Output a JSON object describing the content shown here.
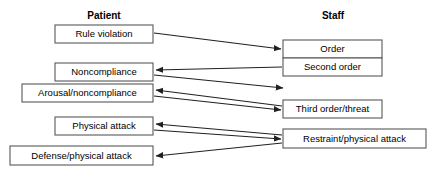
{
  "diagram": {
    "columns": [
      {
        "id": "patient",
        "label": "Patient",
        "x": 104,
        "y": 16
      },
      {
        "id": "staff",
        "label": "Staff",
        "x": 333,
        "y": 16
      }
    ],
    "colors": {
      "box_fill": "#ffffff",
      "box_stroke": "#58585a",
      "line": "#231f20",
      "text": "#000000",
      "background": "#ffffff"
    },
    "nodes": [
      {
        "id": "rule-violation",
        "label": "Rule violation",
        "column": "patient",
        "x": 55,
        "y": 25,
        "w": 98,
        "h": 18
      },
      {
        "id": "noncompliance",
        "label": "Noncompliance",
        "column": "patient",
        "x": 55,
        "y": 63,
        "w": 98,
        "h": 18
      },
      {
        "id": "arousal-noncompliance",
        "label": "Arousal/noncompliance",
        "column": "patient",
        "x": 22,
        "y": 84,
        "w": 131,
        "h": 18
      },
      {
        "id": "physical-attack",
        "label": "Physical attack",
        "column": "patient",
        "x": 55,
        "y": 117,
        "w": 98,
        "h": 18
      },
      {
        "id": "defense-physical-attack",
        "label": "Defense/physical attack",
        "column": "patient",
        "x": 10,
        "y": 146,
        "w": 143,
        "h": 19
      },
      {
        "id": "order",
        "label": "Order",
        "column": "staff",
        "x": 283,
        "y": 40,
        "w": 99,
        "h": 18
      },
      {
        "id": "second-order",
        "label": "Second order",
        "column": "staff",
        "x": 283,
        "y": 58,
        "w": 99,
        "h": 18
      },
      {
        "id": "third-order-threat",
        "label": "Third order/threat",
        "column": "staff",
        "x": 283,
        "y": 100,
        "w": 99,
        "h": 18
      },
      {
        "id": "restraint-physical-attack",
        "label": "Restraint/physical attack",
        "column": "staff",
        "x": 283,
        "y": 129,
        "w": 143,
        "h": 19
      }
    ],
    "edges": [
      {
        "id": "rule-violation-to-order",
        "from": "rule-violation",
        "to": "order",
        "x1": 154,
        "y1": 33,
        "x2": 281,
        "y2": 49
      },
      {
        "id": "second-order-to-noncompliance",
        "from": "second-order",
        "to": "noncompliance",
        "x1": 282,
        "y1": 67,
        "x2": 155,
        "y2": 70
      },
      {
        "id": "noncompliance-to-third-order",
        "from": "noncompliance",
        "to": "third-order-threat",
        "x1": 154,
        "y1": 75,
        "x2": 281,
        "y2": 88
      },
      {
        "id": "third-order-to-arousal",
        "from": "third-order-threat",
        "to": "arousal-noncompliance",
        "x1": 282,
        "y1": 106,
        "x2": 155,
        "y2": 90
      },
      {
        "id": "arousal-to-third-order",
        "from": "arousal-noncompliance",
        "to": "third-order-threat",
        "x1": 154,
        "y1": 96,
        "x2": 281,
        "y2": 110
      },
      {
        "id": "restraint-to-physical-attack",
        "from": "restraint-physical-attack",
        "to": "physical-attack",
        "x1": 282,
        "y1": 135,
        "x2": 155,
        "y2": 124
      },
      {
        "id": "physical-attack-to-restraint",
        "from": "physical-attack",
        "to": "restraint-physical-attack",
        "x1": 154,
        "y1": 130,
        "x2": 281,
        "y2": 139
      },
      {
        "id": "restraint-to-defense",
        "from": "restraint-physical-attack",
        "to": "defense-physical-attack",
        "x1": 282,
        "y1": 143,
        "x2": 155,
        "y2": 156
      }
    ]
  }
}
